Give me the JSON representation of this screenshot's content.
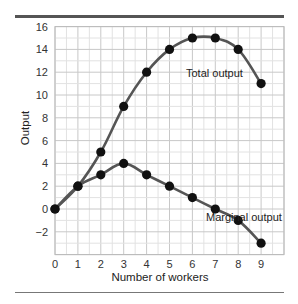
{
  "chart_data": {
    "type": "line",
    "title": "",
    "xlabel": "Number of workers",
    "ylabel": "Output",
    "x": [
      0,
      1,
      2,
      3,
      4,
      5,
      6,
      7,
      8,
      9
    ],
    "x_ticks": [
      "0",
      "1",
      "2",
      "3",
      "4",
      "5",
      "6",
      "7",
      "8",
      "9"
    ],
    "y_ticks": [
      "16",
      "14",
      "12",
      "10",
      "8",
      "6",
      "4",
      "2",
      "0",
      "−2"
    ],
    "xlim": [
      0,
      10
    ],
    "ylim": [
      -4,
      16
    ],
    "grid": true,
    "legend": "inline labels",
    "series": [
      {
        "name": "Total output",
        "values": [
          0,
          2,
          5,
          9,
          12,
          14,
          15,
          15,
          14,
          11
        ]
      },
      {
        "name": "Marginal output",
        "values": [
          0,
          2,
          3,
          4,
          3,
          2,
          1,
          0,
          -1,
          -3
        ]
      }
    ]
  },
  "colors": {
    "line": "#555555",
    "marker": "#111111",
    "grid": "#d4d4d4",
    "rule": "#555555"
  }
}
